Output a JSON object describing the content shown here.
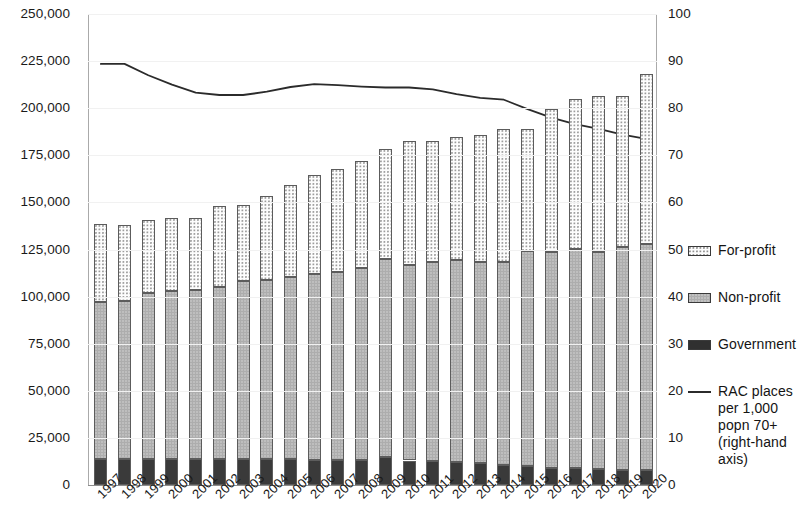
{
  "chart_data": {
    "type": "bar",
    "title": "",
    "subtitle": "",
    "xlabel": "",
    "ylabel": "",
    "y2label": "",
    "grid": false,
    "legend_position": "right",
    "ylim": [
      0,
      250000
    ],
    "y2lim": [
      0,
      100
    ],
    "yticks": [
      "0",
      "25,000",
      "50,000",
      "75,000",
      "100,000",
      "125,000",
      "150,000",
      "175,000",
      "200,000",
      "225,000",
      "250,000"
    ],
    "ytick_values": [
      0,
      25000,
      50000,
      75000,
      100000,
      125000,
      150000,
      175000,
      200000,
      225000,
      250000
    ],
    "y2ticks": [
      "0",
      "10",
      "20",
      "30",
      "40",
      "50",
      "60",
      "70",
      "80",
      "90",
      "100"
    ],
    "y2tick_values": [
      0,
      10,
      20,
      30,
      40,
      50,
      60,
      70,
      80,
      90,
      100
    ],
    "categories": [
      "1997",
      "1998",
      "1999",
      "2000",
      "2001",
      "2002",
      "2003",
      "2004",
      "2005",
      "2006",
      "2007",
      "2008",
      "2009",
      "2010",
      "2011",
      "2012",
      "2013",
      "2014",
      "2015",
      "2016",
      "2017",
      "2018",
      "2019",
      "2020"
    ],
    "series": [
      {
        "name": "Government",
        "stack": "places",
        "order": 0,
        "values": [
          14000,
          14000,
          14000,
          14000,
          13800,
          13800,
          13800,
          14000,
          13700,
          13500,
          13300,
          13500,
          15000,
          13000,
          12500,
          12000,
          11500,
          10500,
          10000,
          9200,
          8800,
          8500,
          8200,
          8000
        ]
      },
      {
        "name": "Non-profit",
        "stack": "places",
        "order": 1,
        "values": [
          83000,
          83500,
          88000,
          89000,
          89500,
          91500,
          94500,
          95000,
          96500,
          98500,
          99500,
          101500,
          105000,
          104000,
          106000,
          107500,
          107000,
          108000,
          114000,
          114500,
          116500,
          115000,
          118000,
          120000
        ]
      },
      {
        "name": "For-profit",
        "stack": "places",
        "order": 2,
        "values": [
          41500,
          40500,
          38500,
          38500,
          38200,
          42700,
          40200,
          44500,
          49300,
          52500,
          55000,
          57000,
          58500,
          65500,
          64000,
          65000,
          67500,
          70500,
          65000,
          76000,
          79500,
          83000,
          80500,
          90000
        ]
      }
    ],
    "stack_totals": [
      138500,
      138000,
      140500,
      141500,
      141500,
      148000,
      148500,
      153500,
      159500,
      164500,
      167800,
      172000,
      178500,
      182500,
      182500,
      184500,
      186000,
      189000,
      189000,
      199700,
      204800,
      206500,
      206700,
      218000
    ],
    "line_series": {
      "name": "RAC places per 1,000 popn 70+ (right-hand axis)",
      "axis": "right",
      "values": [
        89.4,
        89.4,
        87.0,
        85.0,
        83.3,
        82.8,
        82.8,
        83.5,
        84.5,
        85.1,
        84.9,
        84.6,
        84.4,
        84.4,
        84.0,
        83.0,
        82.2,
        81.8,
        79.8,
        78.0,
        76.6,
        75.6,
        74.4,
        73.5
      ]
    }
  },
  "legend": {
    "items": [
      {
        "label": "For-profit",
        "type": "swatch",
        "style": "for",
        "icon": "dotted-square-icon"
      },
      {
        "label": "Non-profit",
        "type": "swatch",
        "style": "non",
        "icon": "grey-square-icon"
      },
      {
        "label": "Government",
        "type": "swatch",
        "style": "gov",
        "icon": "dark-square-icon"
      },
      {
        "label": "RAC places per 1,000 popn 70+ (right-hand axis)",
        "type": "line",
        "style": "line",
        "icon": "line-segment-icon"
      }
    ]
  },
  "colors": {
    "government": "#3a3a3a",
    "nonprofit": "#adadad",
    "forprofit": "#fdfdfd",
    "line": "#2b2b2b",
    "axis": "#8d8d8d",
    "text": "#141414"
  }
}
